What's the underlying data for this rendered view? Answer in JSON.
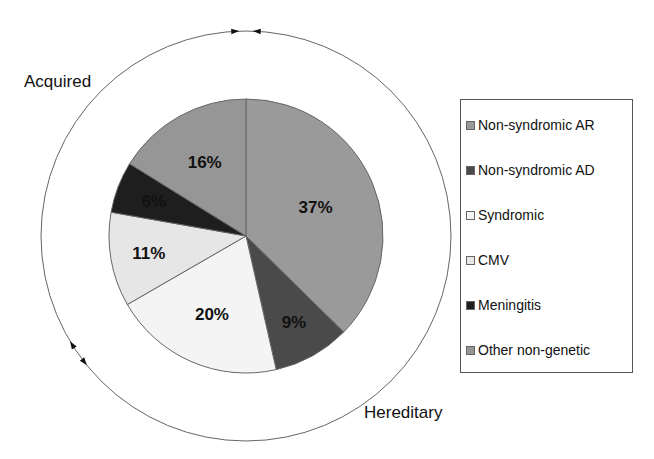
{
  "chart_data": {
    "type": "pie",
    "title": "",
    "categories": [
      "Non-syndromic AR",
      "Non-syndromic AD",
      "Syndromic",
      "CMV",
      "Meningitis",
      "Other non-genetic"
    ],
    "values": [
      37,
      9,
      20,
      11,
      6,
      16
    ],
    "labels": [
      "37%",
      "9%",
      "20%",
      "11%",
      "6%",
      "16%"
    ],
    "colors": [
      "#9a9a9a",
      "#4a4a4a",
      "#f4f4f4",
      "#e6e6e6",
      "#1e1e1e",
      "#969696"
    ],
    "start_angle_deg": 0,
    "direction": "clockwise",
    "legend_position": "right",
    "outer_ring_labels": {
      "acquired": "Acquired",
      "hereditary": "Hereditary"
    },
    "groups": [
      {
        "name": "Hereditary",
        "members": [
          "Non-syndromic AR",
          "Non-syndromic AD",
          "Syndromic"
        ],
        "total": 66
      },
      {
        "name": "Acquired",
        "members": [
          "CMV",
          "Meningitis",
          "Other non-genetic"
        ],
        "total": 33
      }
    ]
  },
  "legend": {
    "items": [
      {
        "label": "Non-syndromic AR",
        "color": "#9a9a9a"
      },
      {
        "label": "Non-syndromic AD",
        "color": "#4a4a4a"
      },
      {
        "label": "Syndromic",
        "color": "#f4f4f4"
      },
      {
        "label": "CMV",
        "color": "#e6e6e6"
      },
      {
        "label": "Meningitis",
        "color": "#1e1e1e"
      },
      {
        "label": "Other non-genetic",
        "color": "#969696"
      }
    ]
  }
}
